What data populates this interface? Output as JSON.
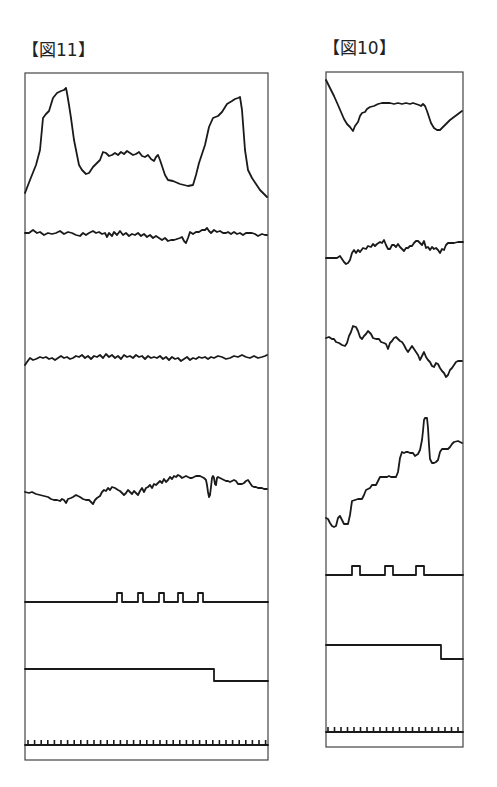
{
  "figures": [
    {
      "id": "fig11",
      "label": "【図11】",
      "frame": {
        "x": 25,
        "y": 73,
        "w": 243,
        "h": 687
      },
      "traces": [
        {
          "name": "waveform-1",
          "points": "25,193 30,180 36,165 40,150 43,118 46,114 49,111 53,98 57,93 61,91 64,90 66,88 67,93 69,105 71,118 74,140 77,155 79,165 82,170 86,174 89,173 93,167 98,162 100,160 103,152 106,153 109,156 112,155 115,153 118,155 121,152 124,154 127,151 130,153 133,155 136,154 139,152 142,156 145,157 148,155 151,159 154,161 156,157 158,155 160,160 162,166 165,175 168,180 173,181 180,184 188,186 193,185 196,175 199,163 202,154 205,145 209,127 213,118 218,116 222,112 227,104 232,101 235,99 238,98 240,97 242,110 245,150 248,170 252,178 256,184 260,190 264,194 267,197"
        },
        {
          "name": "waveform-2",
          "points": "25,233 29,233 33,230 37,233 40,232 44,235 48,233 52,234 56,233 60,231 64,234 68,232 72,233 76,235 80,236 83,233 86,235 89,233 93,231 96,233 99,232 102,234 105,233 107,237 109,233 112,236 114,232 117,235 120,231 123,235 126,233 129,236 132,234 135,235 138,233 141,236 144,234 147,237 150,235 153,238 156,236 159,238 162,240 165,238 168,241 171,240 174,240 177,239 180,238 182,237 184,241 186,243 188,238 190,232 193,234 196,232 199,232 202,230 205,230 207,228 209,231 211,233 214,230 217,232 220,231 223,233 226,233 228,232 231,234 234,232 237,234 240,233 243,235 246,233 249,233 252,233 255,234 258,236 262,234 265,235 267,235"
        },
        {
          "name": "waveform-3",
          "points": "25,365 27,362 30,358 33,360 36,359 40,357 43,358 46,357 49,359 52,358 55,360 58,358 61,356 64,358 67,357 70,359 73,358 76,356 79,357 82,355 85,358 88,356 91,359 94,356 97,357 100,355 103,358 106,354 109,357 112,355 115,358 118,356 121,359 124,355 127,357 130,356 133,358 136,355 139,357 142,356 145,359 148,356 151,358 154,357 157,358 160,356 163,359 166,357 169,360 172,357 175,359 178,358 181,361 184,359 187,357 190,360 193,358 196,359 199,357 202,358 205,357 208,359 211,357 214,358 218,356 222,357 226,359 230,358 234,356 238,357 242,355 246,357 250,358 254,356 258,358 262,357 265,356 267,355"
        },
        {
          "name": "waveform-4",
          "points": "25,492 29,493 32,492 36,494 40,495 44,496 48,497 51,499 54,500 57,500 60,501 62,499 64,500 66,503 68,499 71,498 73,497 76,495 78,496 80,497 83,499 86,500 89,500 91,502 93,504 95,500 97,498 100,496 102,492 104,490 106,491 108,488 110,490 112,487 115,488 118,490 120,491 122,493 124,495 126,493 128,490 130,492 132,494 134,491 136,493 138,495 140,491 142,488 144,492 146,488 148,487 150,485 152,488 154,484 156,485 158,483 160,481 162,483 164,479 166,482 168,480 170,477 172,479 174,476 176,477 178,475 180,476 182,478 184,477 186,476 188,477 190,478 192,478 194,477 196,476 198,476 200,476 202,477 204,478 206,480 207,485 208,492 209,497 210,495 211,487 212,478 213,476 214,478 215,484 216,485 217,478 218,477 220,478 222,479 224,480 226,481 228,481 230,482 232,481 234,480 236,481 238,484 240,484 242,484 244,483 246,481 248,480 250,483 252,486 254,487 256,487 258,488 260,488 262,488 264,489 267,489"
        },
        {
          "name": "pulse-train",
          "points": "25,602 117,602 117,593 122,593 122,602 138,602 138,593 143,593 143,602 159,602 159,593 164,593 164,602 178,602 178,593 183,593 183,602 198,602 198,593 203,593 203,602 268,602"
        },
        {
          "name": "step-signal",
          "points": "25,669 214,669 214,681 268,681"
        },
        {
          "name": "tick-baseline",
          "points": "25,745 268,745"
        }
      ],
      "ticks": {
        "x0": 28,
        "x1": 266,
        "step": 6.6,
        "y_base": 745,
        "height": 5
      }
    },
    {
      "id": "fig10",
      "label": "【図10】",
      "frame": {
        "x": 326,
        "y": 72,
        "w": 137,
        "h": 675
      },
      "traces": [
        {
          "name": "waveform-1",
          "points": "326,80 330,88 334,96 338,105 341,112 344,119 347,124 350,127 353,131 355,126 358,122 360,116 362,113 365,112 367,109 370,107 374,106 378,104 382,103 386,103 390,103 394,104 398,103 402,104 406,103 410,104 413,103 416,104 419,105 421,106 423,104 425,106 427,111 429,117 431,123 434,128 437,130 440,130 443,127 446,124 450,120 454,117 458,114 462,111"
        },
        {
          "name": "waveform-2",
          "points": "326,258 330,258 334,258 337,258 340,256 342,259 344,262 346,264 348,263 350,260 352,253 354,250 356,253 358,250 360,252 363,248 366,249 368,246 371,247 373,244 375,246 377,244 380,242 382,243 384,240 386,245 388,249 390,249 392,245 394,245 396,247 398,244 400,247 402,249 404,251 406,248 408,248 410,246 412,246 414,243 416,241 418,241 420,243 422,245 424,241 426,248 428,247 430,250 432,247 434,249 436,248 438,250 440,253 442,249 444,250 446,245 448,243 450,243 452,243 454,243 458,242 463,242"
        },
        {
          "name": "waveform-3",
          "points": "326,338 329,337 332,339 334,339 336,342 339,343 342,345 345,346 347,343 349,336 351,332 353,326 356,327 358,331 360,337 362,339 364,336 366,334 368,331 371,334 373,338 376,339 379,339 381,342 384,343 386,344 388,349 390,343 392,341 394,338 396,337 398,339 400,341 402,342 404,345 406,349 408,352 410,349 412,346 414,349 416,352 418,355 420,360 422,356 424,352 426,357 428,360 430,362 432,366 434,367 436,363 438,364 440,368 442,371 444,373 446,377 448,375 450,370 452,368 454,365 456,362 458,361 462,361"
        },
        {
          "name": "waveform-4",
          "points": "326,518 328,519 330,523 332,526 334,527 336,526 338,518 340,516 342,520 344,524 346,524 348,524 350,515 352,501 355,500 358,499 362,499 364,495 366,490 368,489 370,488 372,485 376,485 378,481 380,477 382,477 384,477 387,477 389,476 391,477 393,477 396,477 398,472 400,458 402,452 404,453 406,452 408,452 410,453 413,453 415,456 418,454 420,450 422,440 423,431 424,420 425,418 427,418 428,428 429,445 430,459 432,463 434,463 436,462 438,460 440,452 442,449 446,449 448,449 450,447 452,444 454,442 458,441 462,443"
        },
        {
          "name": "pulse-train",
          "points": "326,575 352,575 352,566 360,566 360,575 385,575 385,566 393,566 393,575 416,575 416,566 424,566 424,575 463,575"
        },
        {
          "name": "step-signal",
          "points": "326,645 441,645 441,659 463,659"
        },
        {
          "name": "tick-baseline",
          "points": "326,732 463,732"
        }
      ],
      "ticks": {
        "x0": 328,
        "x1": 462,
        "step": 6.5,
        "y_base": 732,
        "height": 5
      }
    }
  ],
  "colors": {
    "trace": "#1a1a1a",
    "frame": "#444444",
    "background": "#ffffff"
  }
}
